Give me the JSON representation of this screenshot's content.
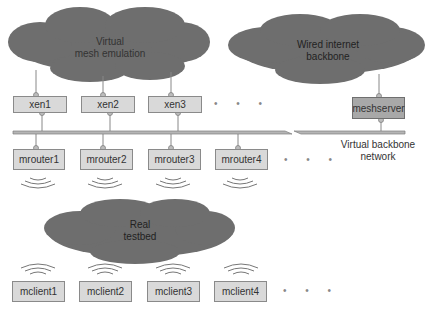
{
  "clouds": {
    "virtual": {
      "line1": "Virtual",
      "line2": "mesh emulation"
    },
    "wired": {
      "line1": "Wired internet",
      "line2": "backbone"
    },
    "real": {
      "line1": "Real",
      "line2": "testbed"
    }
  },
  "xen_nodes": [
    "xen1",
    "xen2",
    "xen3"
  ],
  "server_node": "meshserver",
  "routers": [
    "mrouter1",
    "mrouter2",
    "mrouter3",
    "mrouter4"
  ],
  "clients": [
    "mclient1",
    "mclient2",
    "mclient3",
    "mclient4"
  ],
  "backbone_label": {
    "line1": "Virtual backbone",
    "line2": "network"
  },
  "ellipsis": "• • •",
  "colors": {
    "cloud": "#6e6e6e",
    "node": "#d9d9d9",
    "server": "#a8a8a8",
    "bar": "#b5b5b5"
  }
}
